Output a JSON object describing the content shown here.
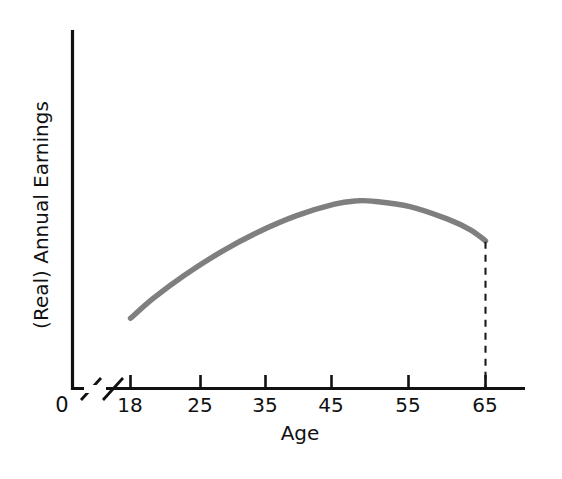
{
  "chart_data": {
    "type": "line",
    "title": "",
    "subtitle": "",
    "xlabel": "Age",
    "ylabel": "(Real) Annual Earnings",
    "x_tick_labels": [
      "18",
      "25",
      "35",
      "45",
      "55",
      "65"
    ],
    "x_tick_values": [
      18,
      25,
      35,
      45,
      55,
      65
    ],
    "origin_label": "0",
    "axis_break": true,
    "axis_break_note": "double-slash break on x-axis between 0 and 18",
    "grid": false,
    "legend": null,
    "xlim": [
      18,
      68
    ],
    "ylim": [
      0,
      1
    ],
    "y_ticks_shown": false,
    "series": [
      {
        "name": "Real annual earnings by age",
        "color": "#7f7f7f",
        "line_width_px": 5.4,
        "x": [
          18,
          21,
          25,
          30,
          35,
          40,
          45,
          48,
          50,
          55,
          60,
          63,
          65
        ],
        "y": [
          0.262,
          0.336,
          0.42,
          0.51,
          0.585,
          0.645,
          0.688,
          0.7,
          0.699,
          0.679,
          0.632,
          0.592,
          0.551
        ],
        "description": "Concave hump-shaped age-earnings profile: rises steeply from age 18, peaks near age 48-50, then declines gradually to age 65."
      }
    ],
    "annotations": [
      {
        "name": "retirement-drop-line",
        "type": "vertical-dashed-line",
        "x": 65,
        "from_y": 0.551,
        "to_y": 0.0,
        "color": "#1a1a1a",
        "style": "dashed",
        "label": ""
      }
    ]
  },
  "figure": {
    "background_color": "#ffffff",
    "axis_color": "#111111",
    "curve_color": "#7f7f7f",
    "dash_color": "#1a1a1a"
  },
  "labels": {
    "y_axis_title": "(Real) Annual Earnings",
    "x_axis_title": "Age",
    "origin": "0",
    "tick_18": "18",
    "tick_25": "25",
    "tick_35": "35",
    "tick_45": "45",
    "tick_55": "55",
    "tick_65": "65"
  }
}
